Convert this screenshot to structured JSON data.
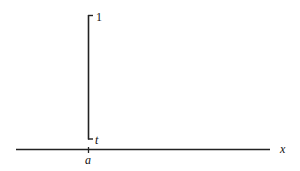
{
  "diagram": {
    "type": "number-line-with-interval",
    "axis": {
      "label": "x",
      "tick_label": "a"
    },
    "interval": {
      "top_label": "1",
      "bottom_label": "t"
    }
  },
  "colors": {
    "stroke": "#222222",
    "background": "#ffffff"
  }
}
